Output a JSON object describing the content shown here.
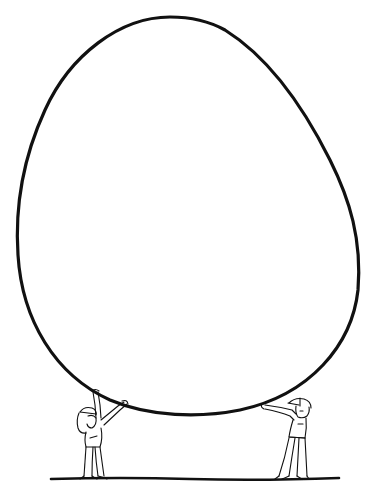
{
  "illustration": {
    "description": "Line drawing of a giant egg held up by two small people",
    "colors": {
      "stroke": "#111111",
      "background": "#ffffff"
    },
    "egg": {
      "label": "giant egg outline"
    },
    "figures": [
      {
        "label": "girl with cap lifting egg (left)"
      },
      {
        "label": "man with cap lifting egg (right)"
      }
    ],
    "ground": {
      "label": "ground line"
    }
  }
}
